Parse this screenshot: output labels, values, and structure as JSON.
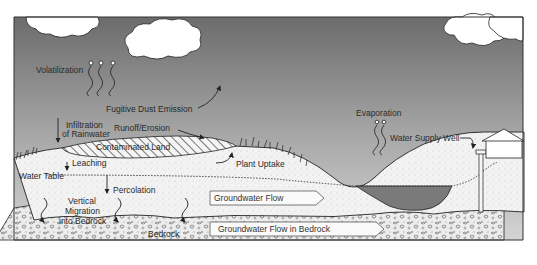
{
  "diagram": {
    "title": "",
    "labels": {
      "volatilization": "Volatilization",
      "fugitive_dust": "Fugitive Dust Emission",
      "infiltration_line1": "Infiltration",
      "infiltration_line2": "of Rainwater",
      "runoff": "Runoff/Erosion",
      "contaminated_land": "Contaminated Land",
      "plant_uptake": "Plant Uptake",
      "leaching": "Leaching",
      "water_table": "Water Table",
      "percolation": "Percolation",
      "vertical_line1": "Vertical",
      "vertical_line2": "Migration",
      "vertical_line3": "into Bedrock",
      "groundwater_flow": "Groundwater Flow",
      "bedrock": "Bedrock",
      "groundwater_flow_bedrock": "Groundwater Flow in Bedrock",
      "evaporation": "Evaporation",
      "water_supply_well": "Water Supply Well"
    },
    "colors": {
      "sky_top": "#6f6f6f",
      "sky_bottom": "#cfcfcf",
      "soil": "#f2f2f2",
      "pond": "#7d7d7d",
      "bedrock": "#e6e6e6",
      "line": "#222222",
      "cloud": "#ffffff"
    }
  }
}
